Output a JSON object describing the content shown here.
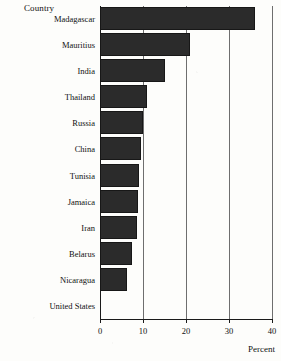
{
  "chart_data": {
    "type": "bar",
    "orientation": "horizontal",
    "title": "",
    "xlabel": "Percent",
    "ylabel": "Country",
    "categories": [
      "Madagascar",
      "Mauritius",
      "India",
      "Thailand",
      "Russia",
      "China",
      "Tunisia",
      "Jamaica",
      "Iran",
      "Belarus",
      "Nicaragua",
      "United States"
    ],
    "values": [
      36.0,
      21.0,
      15.0,
      11.0,
      10.0,
      9.5,
      9.0,
      8.8,
      8.5,
      7.5,
      6.3,
      0.0
    ],
    "xlim": [
      0,
      40
    ],
    "xticks": [
      0,
      10,
      20,
      30,
      40
    ],
    "xtick_labels": [
      "0",
      "10",
      "20",
      "30",
      "40"
    ],
    "grid": "vertical",
    "legend": "none",
    "bar_color": "#2b2b2b",
    "background_color": "#fdfdfb"
  },
  "axes": {
    "category_axis_title": "Country",
    "value_axis_title": "Percent"
  }
}
